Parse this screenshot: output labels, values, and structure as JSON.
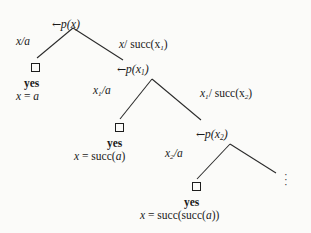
{
  "figure": {
    "background_color": "#fbfbf9",
    "ink_color": "#1a1a1a"
  },
  "nodes": {
    "root": {
      "arrow": "←",
      "label": "p(x)"
    },
    "level1": {
      "arrow": "←",
      "label": "p(x",
      "sub": "1",
      "close": ")"
    },
    "level2": {
      "arrow": "←",
      "label": "p(x",
      "sub": "2",
      "close": ")"
    }
  },
  "edge_labels": {
    "e1_left": {
      "var": "x",
      "slash": "/",
      "term": "a"
    },
    "e1_right": {
      "var": "x",
      "slash": "/ ",
      "term": "succ(x",
      "sub": "1",
      "close": ")"
    },
    "e2_left": {
      "var": "x",
      "sub": "1",
      "slash": "/",
      "term": "a"
    },
    "e2_right": {
      "var": "x",
      "sub": "1",
      "slash": "/ ",
      "term": "succ(x",
      "sub2": "2",
      "close": ")"
    },
    "e3_left": {
      "var": "x",
      "sub": "2",
      "slash": "/",
      "term": "a"
    }
  },
  "leaves": [
    {
      "box": "empty-clause",
      "yes": "yes",
      "answer_lhs": "x",
      "answer_eq": " = ",
      "answer_rhs": "a",
      "answer_rhs_roman": ""
    },
    {
      "box": "empty-clause",
      "yes": "yes",
      "answer_lhs": "x",
      "answer_eq": " = ",
      "answer_rhs": "succ(",
      "answer_rhs_arg": "a",
      "answer_rhs_close": ")"
    },
    {
      "box": "empty-clause",
      "yes": "yes",
      "answer_lhs": "x",
      "answer_eq": " = ",
      "answer_rhs": "succ(succ(",
      "answer_rhs_arg": "a",
      "answer_rhs_close": "))"
    }
  ],
  "continuation": {
    "symbol": "vertical-ellipsis",
    "dots": "·"
  }
}
